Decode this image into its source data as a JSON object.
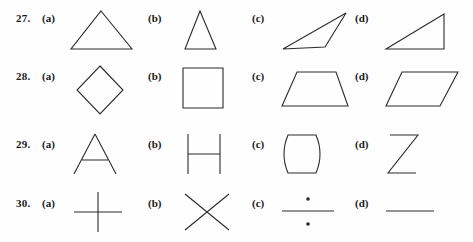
{
  "page": {
    "background_color": "#fefefe",
    "ink_color": "#2b2b2b",
    "label_color": "#1a1a1a"
  },
  "exercises": [
    {
      "number": "27.",
      "y": 12,
      "options": [
        {
          "label": "(a)",
          "shape_name": "equilateral-triangle",
          "x": 68,
          "y": 8,
          "w": 70,
          "h": 44,
          "svg": "M33,3 L64,41 L3,41 Z"
        },
        {
          "label": "(b)",
          "shape_name": "narrow-isosceles-triangle",
          "x": 178,
          "y": 8,
          "w": 48,
          "h": 44,
          "svg": "M22,3 L38,41 L7,41 Z"
        },
        {
          "label": "(c)",
          "shape_name": "thin-sliver-triangle",
          "x": 278,
          "y": 8,
          "w": 72,
          "h": 44,
          "svg": "M68,5 L5,41 L47,39 Z"
        },
        {
          "label": "(d)",
          "shape_name": "right-triangle",
          "x": 382,
          "y": 8,
          "w": 72,
          "h": 44,
          "svg": "M62,6 L62,41 L4,41 Z"
        }
      ]
    },
    {
      "number": "28.",
      "y": 70,
      "options": [
        {
          "label": "(a)",
          "shape_name": "rhombus",
          "x": 68,
          "y": 64,
          "w": 60,
          "h": 52,
          "svg": "M32,2 L55,26 L32,50 L9,26 Z"
        },
        {
          "label": "(b)",
          "shape_name": "square",
          "x": 178,
          "y": 64,
          "w": 56,
          "h": 52,
          "svg": "M5,4 L45,4 L45,44 L5,44 Z"
        },
        {
          "label": "(c)",
          "shape_name": "trapezoid",
          "x": 278,
          "y": 64,
          "w": 76,
          "h": 52,
          "svg": "M19,8 L58,8 L70,42 L4,42 Z"
        },
        {
          "label": "(d)",
          "shape_name": "parallelogram",
          "x": 382,
          "y": 64,
          "w": 82,
          "h": 52,
          "svg": "M20,8 L76,8 L58,42 L4,42 Z"
        }
      ]
    },
    {
      "number": "29.",
      "y": 138,
      "options": [
        {
          "label": "(a)",
          "shape_name": "letter-a-figure",
          "x": 68,
          "y": 130,
          "w": 60,
          "h": 46,
          "svg": "M27,4 L48,44 M27,4 L6,44 M14,30 L40,30"
        },
        {
          "label": "(b)",
          "shape_name": "letter-h-figure",
          "x": 178,
          "y": 130,
          "w": 52,
          "h": 46,
          "svg": "M10,4 L10,44 M42,4 L42,44 M10,24 L42,24"
        },
        {
          "label": "(c)",
          "shape_name": "barrel-figure",
          "x": 278,
          "y": 130,
          "w": 52,
          "h": 46,
          "svg": "M10,5 L38,5 Q46,24 38,43 L10,43 Q2,24 10,5 Z"
        },
        {
          "label": "(d)",
          "shape_name": "letter-z-figure",
          "x": 382,
          "y": 130,
          "w": 50,
          "h": 46,
          "svg": "M8,5 L36,5 L6,43 L34,43"
        }
      ]
    },
    {
      "number": "30.",
      "y": 197,
      "options": [
        {
          "label": "(a)",
          "shape_name": "plus-cross-figure",
          "x": 68,
          "y": 190,
          "w": 62,
          "h": 44,
          "svg": "M6,22 L54,22 M30,2 L30,42"
        },
        {
          "label": "(b)",
          "shape_name": "x-cross-figure",
          "x": 178,
          "y": 190,
          "w": 60,
          "h": 44,
          "svg": "M7,4 L51,40 M51,4 L7,40"
        },
        {
          "label": "(c)",
          "shape_name": "division-sign-figure",
          "x": 278,
          "y": 190,
          "w": 62,
          "h": 44,
          "svg": "M4,21 L56,21",
          "dots": [
            {
              "cx": 30,
              "cy": 9,
              "r": 1.8
            },
            {
              "cx": 30,
              "cy": 34,
              "r": 1.8
            }
          ]
        },
        {
          "label": "(d)",
          "shape_name": "horizontal-line-figure",
          "x": 382,
          "y": 190,
          "w": 62,
          "h": 44,
          "svg": "M4,21 L52,21"
        }
      ]
    }
  ],
  "option_label_x": [
    42,
    148,
    252,
    355
  ],
  "row_number_x": 16
}
